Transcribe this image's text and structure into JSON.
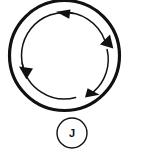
{
  "figure": {
    "background_color": "#ffffff",
    "stroke_color": "#111111",
    "outer_circle": {
      "name": "outer-ring",
      "cx": 64.5,
      "cy": 55.5,
      "r": 55,
      "stroke_width": 3.2
    },
    "inner_circulation": {
      "name": "inner-arrow-ring",
      "cx": 64.5,
      "cy": 55.5,
      "r": 43,
      "stroke_width": 1.5,
      "direction": "counterclockwise",
      "arrow_count": 4,
      "arrow_positions_deg": [
        90,
        200,
        270,
        20
      ],
      "arrow_labels": [
        "arrowhead-top-pointing-left",
        "arrowhead-left-pointing-down",
        "arrowhead-bottom-pointing-right",
        "arrowhead-right-pointing-up"
      ]
    },
    "source_node": {
      "name": "source-circle",
      "label": "J",
      "cx": 72,
      "cy": 133,
      "r": 15,
      "stroke_width": 1.4
    }
  }
}
